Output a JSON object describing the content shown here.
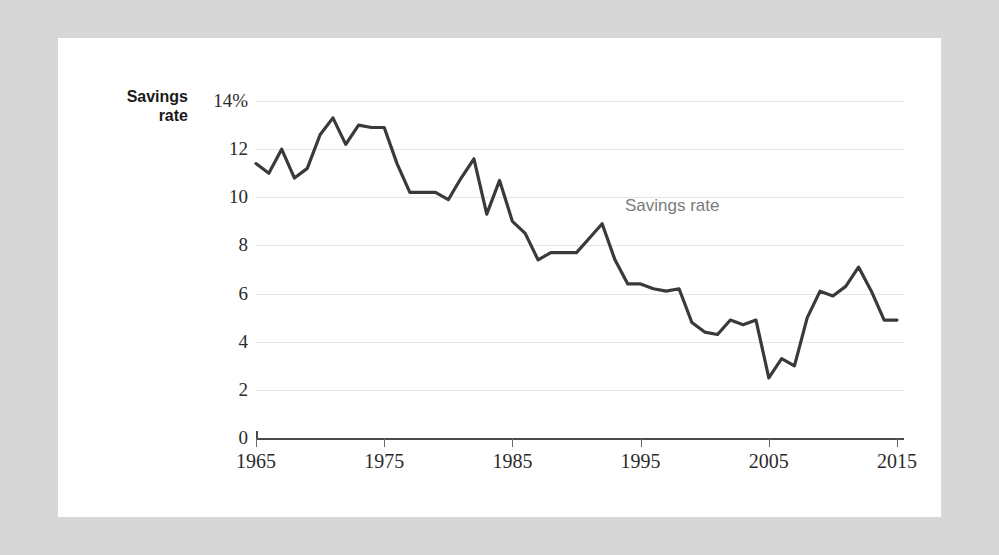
{
  "canvas": {
    "background_color": "#d7d7d7",
    "panel_color": "#ffffff"
  },
  "axis_label": {
    "line1": "Savings",
    "line2": "rate"
  },
  "annotation": {
    "text": "Savings rate",
    "color": "#7b7b7b"
  },
  "chart_data": {
    "type": "line",
    "title": "",
    "subtitle": "",
    "xlabel": "",
    "ylabel": "Savings rate",
    "series_name": "Savings rate",
    "line_color": "#3a3a3a",
    "grid": true,
    "grid_color": "#e6e6e6",
    "legend": "inline-annotation",
    "legend_position": "inside-upper-right",
    "xlim": [
      1965,
      2015
    ],
    "ylim": [
      0,
      14
    ],
    "yticks": [
      0,
      2,
      4,
      6,
      8,
      10,
      12,
      14
    ],
    "ytick_labels": [
      "0",
      "2",
      "4",
      "6",
      "8",
      "10",
      "12",
      "14%"
    ],
    "xticks": [
      1965,
      1975,
      1985,
      1995,
      2005,
      2015
    ],
    "xtick_labels": [
      "1965",
      "1975",
      "1985",
      "1995",
      "2005",
      "2015"
    ],
    "x": [
      1965,
      1966,
      1967,
      1968,
      1969,
      1970,
      1971,
      1972,
      1973,
      1974,
      1975,
      1976,
      1977,
      1978,
      1979,
      1980,
      1981,
      1982,
      1983,
      1984,
      1985,
      1986,
      1987,
      1988,
      1989,
      1990,
      1991,
      1992,
      1993,
      1994,
      1995,
      1996,
      1997,
      1998,
      1999,
      2000,
      2001,
      2002,
      2003,
      2004,
      2005,
      2006,
      2007,
      2008,
      2009,
      2010,
      2011,
      2012,
      2013,
      2014,
      2015
    ],
    "values": [
      11.4,
      11.0,
      12.0,
      10.8,
      11.2,
      12.6,
      13.3,
      12.2,
      13.0,
      12.9,
      12.9,
      11.4,
      10.2,
      10.2,
      10.2,
      9.9,
      10.8,
      11.6,
      9.3,
      10.7,
      9.0,
      8.5,
      7.4,
      7.7,
      7.7,
      7.7,
      8.3,
      8.9,
      7.4,
      6.4,
      6.4,
      6.2,
      6.1,
      6.2,
      4.8,
      4.4,
      4.3,
      4.9,
      4.7,
      4.9,
      2.5,
      3.3,
      3.0,
      5.0,
      6.1,
      5.9,
      6.3,
      7.1,
      6.1,
      4.9,
      4.9
    ]
  }
}
